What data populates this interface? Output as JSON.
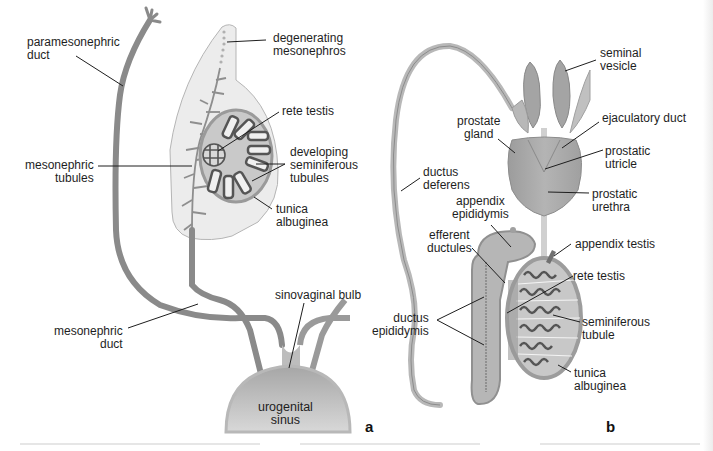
{
  "figure": {
    "panels": [
      {
        "id": "a",
        "label": "a",
        "labels": {
          "paramesonephric_duct": "paramesonephric\nduct",
          "degenerating_mesonephros": "degenerating\nmesonephros",
          "rete_testis": "rete testis",
          "mesonephric_tubules": "mesonephric\ntubules",
          "developing_seminiferous_tubules": "developing\nseminiferous\ntubules",
          "tunica_albuginea": "tunica\nalbuginea",
          "sinovaginal_bulb": "sinovaginal bulb",
          "mesonephric_duct": "mesonephric\nduct",
          "urogenital_sinus": "urogenital\nsinus"
        }
      },
      {
        "id": "b",
        "label": "b",
        "labels": {
          "seminal_vesicle": "seminal\nvesicle",
          "prostate_gland": "prostate\ngland",
          "ejaculatory_duct": "ejaculatory duct",
          "prostatic_utricle": "prostatic\nutricle",
          "ductus_deferens": "ductus\ndeferens",
          "prostatic_urethra": "prostatic\nurethra",
          "appendix_epididymis": "appendix\nepididymis",
          "efferent_ductules": "efferent\nductules",
          "appendix_testis": "appendix testis",
          "rete_testis": "rete testis",
          "ductus_epididymis": "ductus\nepididymis",
          "seminiferous_tubule": "seminiferous\ntubule",
          "tunica_albuginea": "tunica\nalbuginea"
        }
      }
    ],
    "colors": {
      "duct": "#8a8a8a",
      "duct_light": "#b8b8b8",
      "mesonephros_fill": "#ececec",
      "testis_fill": "#c8c8c8",
      "tubule": "#5a5a5a",
      "prostate": "#a9a9a9",
      "sinus": "#9a9a9a",
      "leader": "#1e1e1e"
    }
  }
}
